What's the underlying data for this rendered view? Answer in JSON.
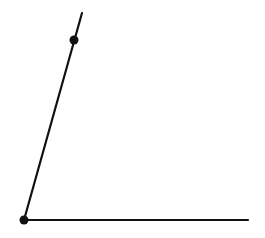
{
  "diagram": {
    "type": "angle",
    "background": "#ffffff",
    "stroke_color": "#111111",
    "vertex": {
      "x": 24,
      "y": 220
    },
    "ray_horizontal_end": {
      "x": 248,
      "y": 220
    },
    "ray_slanted_end": {
      "x": 82,
      "y": 13
    },
    "points": [
      {
        "name": "vertex-point",
        "x": 24,
        "y": 220,
        "r": 4.5
      },
      {
        "name": "ray-point",
        "x": 74,
        "y": 40,
        "r": 4.5
      }
    ]
  }
}
